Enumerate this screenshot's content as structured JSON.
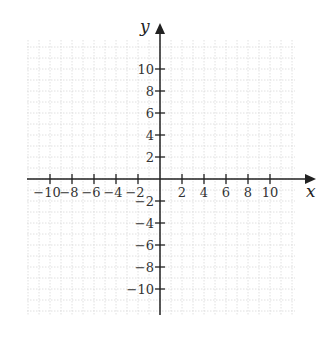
{
  "chart_data": {
    "type": "scatter",
    "title": "",
    "xlabel": "x",
    "ylabel": "y",
    "xlim": [
      -12,
      12
    ],
    "ylim": [
      -12,
      12
    ],
    "grid": true,
    "x_ticks": [
      -10,
      -8,
      -6,
      -4,
      -2,
      2,
      4,
      6,
      8,
      10
    ],
    "y_ticks": [
      10,
      8,
      6,
      4,
      2,
      -2,
      -4,
      -6,
      -8,
      -10
    ],
    "x_tick_labels": [
      "−10",
      "−8",
      "−6",
      "−4",
      "−2",
      "2",
      "4",
      "6",
      "8",
      "10"
    ],
    "y_tick_labels": [
      "10",
      "8",
      "6",
      "4",
      "2",
      "−2",
      "−4",
      "−6",
      "−8",
      "−10"
    ],
    "series": []
  },
  "axes": {
    "x_label": "x",
    "y_label": "y",
    "color": "#222222",
    "grid_color": "#d8d8d8"
  }
}
